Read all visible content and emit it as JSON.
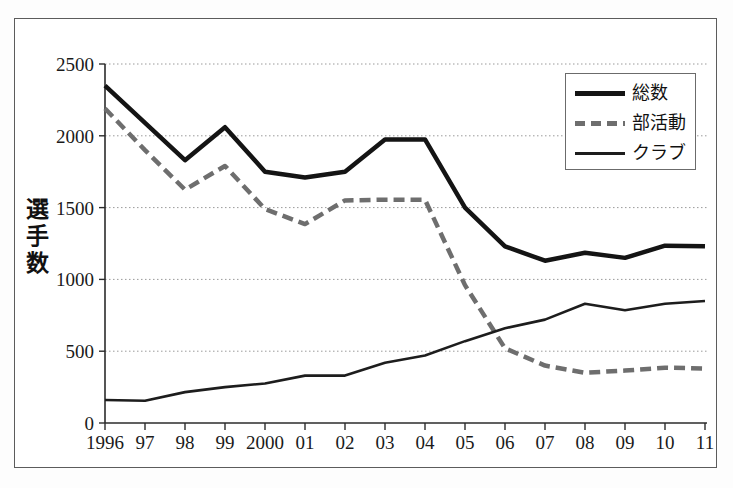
{
  "figure": {
    "background_color": "#ffffff",
    "frame_color": "#5c5c5c"
  },
  "chart_data": {
    "type": "line",
    "title": "",
    "subtitle": "",
    "xlabel": "",
    "ylabel": "選手数",
    "ylabel_chars": [
      "選",
      "手",
      "数"
    ],
    "x": [
      "1996",
      "97",
      "98",
      "99",
      "2000",
      "01",
      "02",
      "03",
      "04",
      "05",
      "06",
      "07",
      "08",
      "09",
      "10",
      "11"
    ],
    "categories": [
      "1996",
      "97",
      "98",
      "99",
      "2000",
      "01",
      "02",
      "03",
      "04",
      "05",
      "06",
      "07",
      "08",
      "09",
      "10",
      "11"
    ],
    "xlim": [
      1996,
      2011
    ],
    "ylim": [
      0,
      2500
    ],
    "yticks": [
      0,
      500,
      1000,
      1500,
      2000,
      2500
    ],
    "ytick_labels": [
      "0",
      "500",
      "1000",
      "1500",
      "2000",
      "2500"
    ],
    "grid": true,
    "grid_style": "dotted-horizontal",
    "grid_color": "#9a9a9a",
    "legend_position": "top-right",
    "series": [
      {
        "name": "総数",
        "style": "solid-thick",
        "color": "#141414",
        "width": 4.5,
        "values": [
          2350,
          2090,
          1830,
          2060,
          1750,
          1710,
          1750,
          1975,
          1975,
          1500,
          1230,
          1130,
          1185,
          1150,
          1235,
          1230
        ]
      },
      {
        "name": "部活動",
        "style": "dashed",
        "color": "#6e6e6e",
        "width": 4.5,
        "values": [
          2190,
          1900,
          1625,
          1790,
          1490,
          1385,
          1550,
          1555,
          1555,
          960,
          520,
          400,
          350,
          365,
          385,
          380
        ]
      },
      {
        "name": "クラブ",
        "style": "solid-thin",
        "color": "#1d1d1d",
        "width": 2.6,
        "values": [
          160,
          155,
          215,
          250,
          275,
          330,
          330,
          420,
          470,
          570,
          660,
          720,
          830,
          785,
          830,
          850
        ]
      }
    ]
  },
  "legend": {
    "entries": [
      {
        "label": "総数",
        "swatch": "solid-thick-black"
      },
      {
        "label": "部活動",
        "swatch": "dashed-gray"
      },
      {
        "label": "クラブ",
        "swatch": "solid-thin-black"
      }
    ]
  }
}
